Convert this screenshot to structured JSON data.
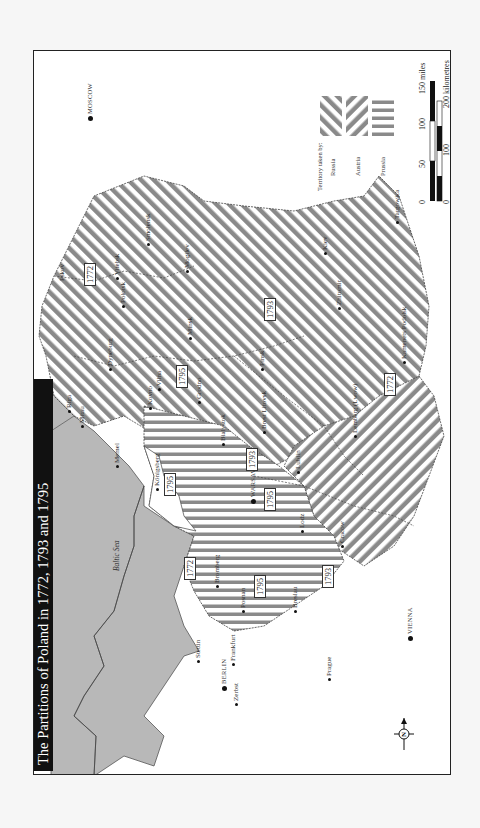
{
  "title": "The Partitions of Poland in 1772, 1793 and 1795",
  "sea_label": "Baltic Sea",
  "legend": {
    "heading": "Territory taken by:",
    "items": [
      {
        "label": "Russia",
        "pattern": "diagonal-stripes"
      },
      {
        "label": "Austria",
        "pattern": "reverse-diagonal-stripes"
      },
      {
        "label": "Prussia",
        "pattern": "vertical-stripes"
      }
    ]
  },
  "scale": {
    "miles_ticks": [
      "0",
      "50",
      "100",
      "150 miles"
    ],
    "km_ticks": [
      "0",
      "100",
      "200 kilometres"
    ]
  },
  "compass": {
    "label": "N"
  },
  "capitals": [
    {
      "name": "MOSCOW"
    },
    {
      "name": "WARSAW"
    },
    {
      "name": "BERLIN"
    },
    {
      "name": "VIENNA"
    }
  ],
  "cities": [
    "Pskov",
    "Smolensk",
    "Vitebsk",
    "Polotsk",
    "Mogilev",
    "Minsk",
    "Dyneburg",
    "Riga",
    "Mitau",
    "Vilna",
    "Kovno",
    "Grodno",
    "Memel",
    "Königsberg",
    "Bialystok",
    "Brest Litovsk",
    "Pinsk",
    "Kiev",
    "Zhitomir",
    "Targowica",
    "Kamenets Podolsk",
    "Lublin",
    "Lemberg (Lwow)",
    "Cracow",
    "Lodz",
    "Bromberg",
    "Posnan",
    "Breslau",
    "Stettin",
    "Frankfurt",
    "Zerbst",
    "Prague"
  ],
  "year_labels": [
    "1772",
    "1793",
    "1795",
    "1795",
    "1772",
    "1793",
    "1795",
    "1795",
    "1772",
    "1793"
  ],
  "colors": {
    "stripe": "#8a8a8a",
    "sea": "#b8b8b8",
    "title_bg": "#111111",
    "frame": "#222222"
  }
}
